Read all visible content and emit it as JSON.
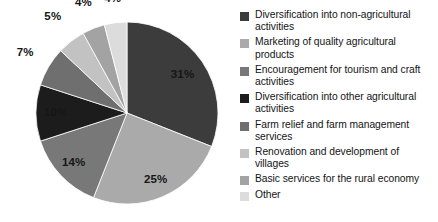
{
  "chart_data": {
    "type": "pie",
    "title": "",
    "subtitle": "",
    "xlabel": "",
    "ylabel": "",
    "legend_position": "right",
    "grid": false,
    "start_angle_deg": 0,
    "direction": "clockwise",
    "categories": [
      "Diversification into non-agricultural activities",
      "Marketing of quality agricultural products",
      "Encouragement for tourism and craft activities",
      "Diversification into other agricultural activities",
      "Farm relief and farm management services",
      "Renovation and development of villages",
      "Basic services for the rural economy",
      "Other"
    ],
    "values": [
      31,
      25,
      14,
      10,
      7,
      5,
      4,
      4
    ],
    "data_labels": [
      "31%",
      "25%",
      "14%",
      "10%",
      "7%",
      "5%",
      "4%",
      "4%"
    ],
    "colors": [
      "#3c3c3c",
      "#aaaaaa",
      "#787878",
      "#1c1c1c",
      "#6f6f6f",
      "#c2c2c2",
      "#a3a3a3",
      "#dcdcdc"
    ],
    "units": "percent"
  },
  "legend": {
    "items": [
      {
        "label": "Diversification into non-agricultural activities",
        "color": "#3c3c3c",
        "value": "31%"
      },
      {
        "label": "Marketing of quality agricultural products",
        "color": "#aaaaaa",
        "value": "25%"
      },
      {
        "label": "Encouragement for tourism and craft activities",
        "color": "#787878",
        "value": "14%"
      },
      {
        "label": "Diversification into other agricultural activities",
        "color": "#1c1c1c",
        "value": "10%"
      },
      {
        "label": "Farm relief and farm management services",
        "color": "#6f6f6f",
        "value": "7%"
      },
      {
        "label": "Renovation and development of villages",
        "color": "#c2c2c2",
        "value": "5%"
      },
      {
        "label": "Basic services for the rural economy",
        "color": "#a3a3a3",
        "value": "4%"
      },
      {
        "label": "Other",
        "color": "#dcdcdc",
        "value": "4%"
      }
    ]
  }
}
